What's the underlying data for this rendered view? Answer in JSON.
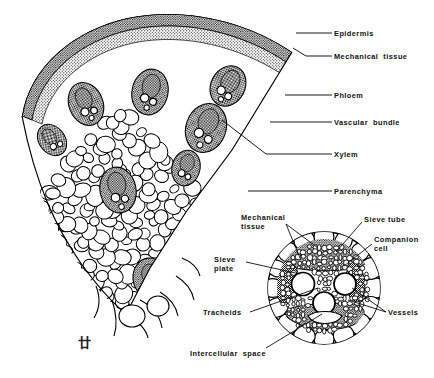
{
  "figure": {
    "type": "botanical-line-drawing",
    "ink_color": "#000000",
    "background_color": "#ffffff",
    "signature": "廿"
  },
  "main_diagram": {
    "name": "stem-sector-wedge",
    "description": "Wedge-shaped sector of a monocot/herbaceous stem cross-section showing epidermis, mechanical tissue, scattered vascular bundles and parenchyma"
  },
  "main_labels": [
    {
      "id": "epidermis",
      "text": "Epidermis",
      "x": 334,
      "y": 30,
      "leader": {
        "x1": 332,
        "y1": 33,
        "x2": 296,
        "y2": 33
      }
    },
    {
      "id": "mechanical-tissue",
      "text": "Mechanical  tissue",
      "x": 334,
      "y": 53,
      "leader": {
        "x1": 332,
        "y1": 56,
        "x2": 300,
        "y2": 56
      }
    },
    {
      "id": "phloem",
      "text": "Phloem",
      "x": 334,
      "y": 92,
      "leader": {
        "x1": 332,
        "y1": 95,
        "x2": 285,
        "y2": 95
      }
    },
    {
      "id": "vascular-bundle",
      "text": "Vascular  bundle",
      "x": 334,
      "y": 119,
      "leader": {
        "x1": 332,
        "y1": 122,
        "x2": 270,
        "y2": 122
      }
    },
    {
      "id": "xylem",
      "text": "Xylem",
      "x": 334,
      "y": 151,
      "leader": {
        "x1": 332,
        "y1": 154,
        "x2": 255,
        "y2": 154
      }
    },
    {
      "id": "parenchyma",
      "text": "Parenchyma",
      "x": 334,
      "y": 188,
      "leader": {
        "x1": 332,
        "y1": 191,
        "x2": 248,
        "y2": 191
      }
    }
  ],
  "inset_diagram": {
    "name": "vascular-bundle-detail",
    "description": "Magnified circular detail of a single vascular bundle",
    "circle": {
      "cx": 324,
      "cy": 288,
      "r": 57
    }
  },
  "inset_labels": [
    {
      "id": "mechanical-tissue-inset",
      "text": "Mechanical\ntissue",
      "x": 241,
      "y": 216,
      "align": "left"
    },
    {
      "id": "sieve-tube",
      "text": "Sieve tube",
      "x": 364,
      "y": 218,
      "align": "left"
    },
    {
      "id": "companion-cell",
      "text": "Companion\ncell",
      "x": 374,
      "y": 238,
      "align": "left"
    },
    {
      "id": "sieve-plate",
      "text": "Sieve\nplate",
      "x": 214,
      "y": 258,
      "align": "left"
    },
    {
      "id": "tracheids",
      "text": "Tracheids",
      "x": 205,
      "y": 311,
      "align": "left"
    },
    {
      "id": "vessels",
      "text": "Vessels",
      "x": 388,
      "y": 311,
      "align": "left"
    },
    {
      "id": "intercellular-space",
      "text": "Intercellular  space",
      "x": 190,
      "y": 352,
      "align": "left"
    }
  ]
}
